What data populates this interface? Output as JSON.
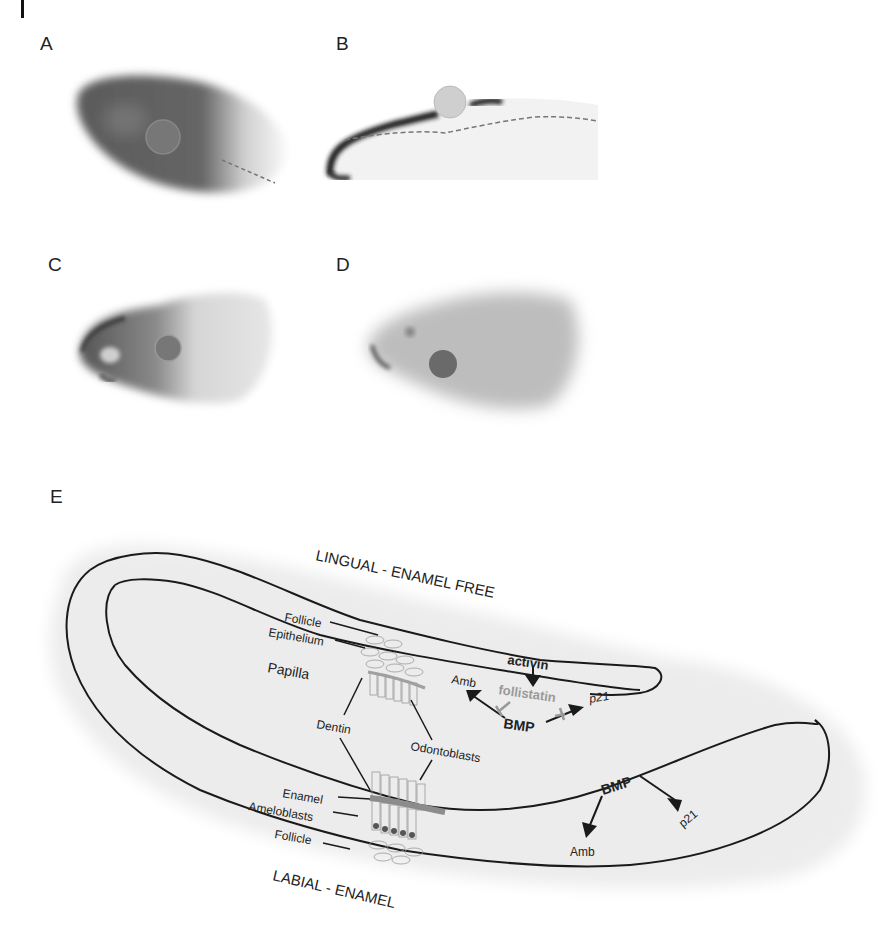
{
  "figure": {
    "panels": [
      {
        "id": "A",
        "label": "A",
        "description": "Whole-mount stained incisor, dark staining over the proximal region with a circular bead; dashed line at right"
      },
      {
        "id": "B",
        "label": "B",
        "description": "Section of incisor with dark epithelial staining along the labial/top edge, bead on top, dashed line marking the border"
      },
      {
        "id": "C",
        "label": "C",
        "description": "Whole-mount incisor with darker staining at the tip and a bead"
      },
      {
        "id": "D",
        "label": "D",
        "description": "Whole-mount incisor with light uniform staining and a dark bead"
      },
      {
        "id": "E",
        "label": "E",
        "description": "Schematic of mouse incisor lingual and labial regions"
      }
    ],
    "diagram": {
      "top_label": "LINGUAL - ENAMEL FREE",
      "bottom_label": "LABIAL - ENAMEL",
      "tissues": {
        "follicle_top": "Follicle",
        "epithelium": "Epithelium",
        "papilla": "Papilla",
        "dentin": "Dentin",
        "odontoblasts": "Odontoblasts",
        "enamel": "Enamel",
        "ameloblasts": "Ameloblasts",
        "follicle_bottom": "Follicle"
      },
      "lingual_signals": {
        "activin": "activin",
        "follistatin": "follistatin",
        "bmp": "BMP",
        "amb": "Amb",
        "p21": "p21"
      },
      "labial_signals": {
        "bmp": "BMP",
        "amb": "Amb",
        "p21": "p21"
      },
      "colors": {
        "outline": "#1a1a1a",
        "follicle_shade": "#ebebeb",
        "follistatin": "#9a9a9a",
        "enamel": "#8c8c8c"
      }
    }
  }
}
